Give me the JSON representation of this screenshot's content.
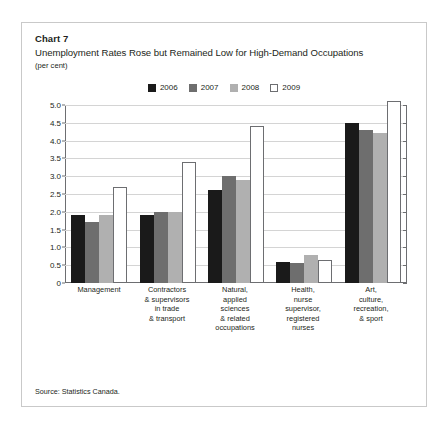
{
  "header": {
    "chart_label": "Chart 7",
    "title": "Unemployment Rates Rose but Remained Low for High-Demand Occupations",
    "units": "(per cent)"
  },
  "footer": {
    "source": "Source: Statistics Canada."
  },
  "legend": {
    "position": "top-center",
    "entries": [
      {
        "label": "2006",
        "color": "#1a1a1a"
      },
      {
        "label": "2007",
        "color": "#6e6e6e"
      },
      {
        "label": "2008",
        "color": "#b0b0b0"
      },
      {
        "label": "2009",
        "color": "#ffffff"
      }
    ]
  },
  "chart_data": {
    "type": "bar",
    "title": "Unemployment Rates Rose but Remained Low for High-Demand Occupations",
    "subtitle": "Chart 7",
    "xlabel": "",
    "ylabel": "(per cent)",
    "ylim": [
      0,
      5.0
    ],
    "yticks": [
      "0",
      "0.5",
      "1.0",
      "1.5",
      "2.0",
      "2.5",
      "3.0",
      "3.5",
      "4.0",
      "4.5",
      "5.0"
    ],
    "ytick_values": [
      0,
      0.5,
      1.0,
      1.5,
      2.0,
      2.5,
      3.0,
      3.5,
      4.0,
      4.5,
      5.0
    ],
    "grid": true,
    "legend_position": "top-center",
    "categories": [
      "Management",
      "Contractors\n& supervisors\nin trade\n& transport",
      "Natural,\napplied\nsciences\n& related\noccupations",
      "Health,\nnurse\nsupervisor,\nregistered\nnurses",
      "Art,\nculture,\nrecreation,\n& sport"
    ],
    "category_lines": [
      [
        "Management"
      ],
      [
        "Contractors",
        "& supervisors",
        "in trade",
        "& transport"
      ],
      [
        "Natural,",
        "applied",
        "sciences",
        "& related",
        "occupations"
      ],
      [
        "Health,",
        "nurse",
        "supervisor,",
        "registered",
        "nurses"
      ],
      [
        "Art,",
        "culture,",
        "recreation,",
        "& sport"
      ]
    ],
    "series": [
      {
        "name": "2006",
        "color": "#1a1a1a",
        "values": [
          1.9,
          1.9,
          2.6,
          0.6,
          4.5
        ]
      },
      {
        "name": "2007",
        "color": "#6e6e6e",
        "values": [
          1.7,
          2.0,
          3.0,
          0.55,
          4.3
        ]
      },
      {
        "name": "2008",
        "color": "#b0b0b0",
        "values": [
          1.9,
          2.0,
          2.9,
          0.8,
          4.2
        ]
      },
      {
        "name": "2009",
        "color": "#ffffff",
        "values": [
          2.7,
          3.4,
          4.4,
          0.65,
          5.1
        ]
      }
    ]
  }
}
